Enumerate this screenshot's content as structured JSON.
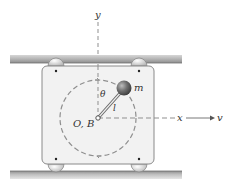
{
  "diagram": {
    "labels": {
      "y_axis": "y",
      "x_axis": "x",
      "velocity": "v",
      "mass": "m",
      "angle": "θ",
      "length": "l",
      "origin": "O, B"
    },
    "colors": {
      "rail": "#a9a9a9",
      "box_fill": "#f2f2f2",
      "box_stroke": "#8a8a8a",
      "dashed": "#8f8f8f",
      "ball": "#6b6b6b",
      "text": "#333333"
    }
  }
}
